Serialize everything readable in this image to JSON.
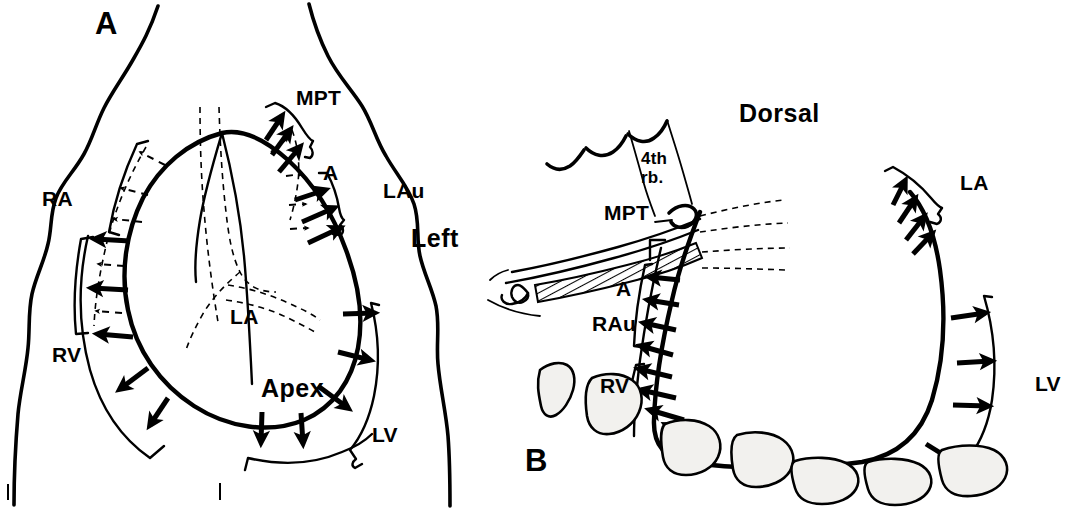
{
  "figure": {
    "background_color": "#ffffff",
    "ink_color": "#000000",
    "width": 1082,
    "height": 511
  },
  "panel_a": {
    "letter": "A",
    "orientation_label": "Left",
    "labels": {
      "right_atrium": "RA",
      "right_ventricle": "RV",
      "main_pulmonary_trunk": "MPT",
      "aorta": "A",
      "left_auricle": "LAu",
      "left_atrium": "LA",
      "apex": "Apex",
      "left_ventricle": "LV"
    }
  },
  "panel_b": {
    "letter": "B",
    "orientation_label": "Dorsal",
    "labels": {
      "fourth_rib_line1": "4th",
      "fourth_rib_line2": "rb.",
      "main_pulmonary_trunk": "MPT",
      "aorta": "A",
      "right_auricle": "RAu",
      "right_ventricle": "RV",
      "left_atrium": "LA",
      "left_ventricle": "LV"
    }
  }
}
